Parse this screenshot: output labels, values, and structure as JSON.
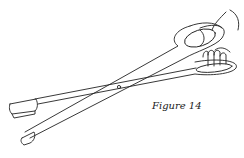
{
  "figure": {
    "caption": "Figure 14",
    "line_color": "#222222",
    "background": "#ffffff"
  }
}
